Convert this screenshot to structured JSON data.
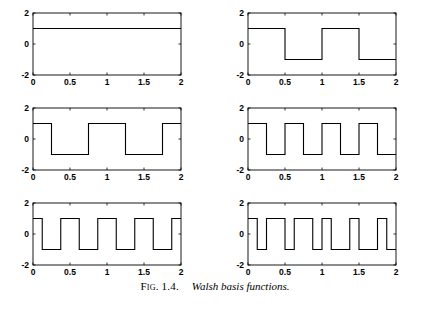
{
  "figure": {
    "caption_label": "Fig. 1.4.",
    "caption_text": "Walsh basis functions.",
    "background": "#ffffff",
    "line_color": "#000000"
  },
  "axes": {
    "xlim": [
      0,
      2
    ],
    "ylim": [
      -2,
      2
    ],
    "xticks": [
      0,
      0.5,
      1,
      1.5,
      2
    ],
    "xtick_labels": [
      "0",
      "0.5",
      "1",
      "1.5",
      "2"
    ],
    "yticks": [
      2,
      0,
      -2
    ],
    "ytick_labels": [
      "2",
      "0",
      "-2"
    ],
    "grid": false
  },
  "chart_data": [
    {
      "type": "line",
      "title": "",
      "name": "walsh-0",
      "sequency": 0,
      "xlabel": "",
      "ylabel": "",
      "xlim": [
        0,
        2
      ],
      "ylim": [
        -2,
        2
      ],
      "xticks": [
        0,
        0.5,
        1,
        1.5,
        2
      ],
      "yticks": [
        -2,
        0,
        2
      ],
      "amplitude": 1,
      "segments": [
        {
          "x0": 0,
          "x1": 2,
          "y": 1
        }
      ]
    },
    {
      "type": "line",
      "title": "",
      "name": "walsh-1",
      "sequency": 1,
      "xlabel": "",
      "ylabel": "",
      "xlim": [
        0,
        2
      ],
      "ylim": [
        -2,
        2
      ],
      "xticks": [
        0,
        0.5,
        1,
        1.5,
        2
      ],
      "yticks": [
        -2,
        0,
        2
      ],
      "amplitude": 1,
      "segments": [
        {
          "x0": 0,
          "x1": 0.5,
          "y": 1
        },
        {
          "x0": 0.5,
          "x1": 1,
          "y": -1
        },
        {
          "x0": 1,
          "x1": 1.5,
          "y": 1
        },
        {
          "x0": 1.5,
          "x1": 2,
          "y": -1
        }
      ]
    },
    {
      "type": "line",
      "title": "",
      "name": "walsh-2",
      "sequency": 2,
      "xlabel": "",
      "ylabel": "",
      "xlim": [
        0,
        2
      ],
      "ylim": [
        -2,
        2
      ],
      "xticks": [
        0,
        0.5,
        1,
        1.5,
        2
      ],
      "yticks": [
        -2,
        0,
        2
      ],
      "amplitude": 1,
      "segments": [
        {
          "x0": 0,
          "x1": 0.25,
          "y": 1
        },
        {
          "x0": 0.25,
          "x1": 0.75,
          "y": -1
        },
        {
          "x0": 0.75,
          "x1": 1.25,
          "y": 1
        },
        {
          "x0": 1.25,
          "x1": 1.75,
          "y": -1
        },
        {
          "x0": 1.75,
          "x1": 2,
          "y": 1
        }
      ]
    },
    {
      "type": "line",
      "title": "",
      "name": "walsh-3",
      "sequency": 3,
      "xlabel": "",
      "ylabel": "",
      "xlim": [
        0,
        2
      ],
      "ylim": [
        -2,
        2
      ],
      "xticks": [
        0,
        0.5,
        1,
        1.5,
        2
      ],
      "yticks": [
        -2,
        0,
        2
      ],
      "amplitude": 1,
      "segments": [
        {
          "x0": 0,
          "x1": 0.25,
          "y": 1
        },
        {
          "x0": 0.25,
          "x1": 0.5,
          "y": -1
        },
        {
          "x0": 0.5,
          "x1": 0.75,
          "y": 1
        },
        {
          "x0": 0.75,
          "x1": 1.0,
          "y": -1
        },
        {
          "x0": 1.0,
          "x1": 1.25,
          "y": 1
        },
        {
          "x0": 1.25,
          "x1": 1.5,
          "y": -1
        },
        {
          "x0": 1.5,
          "x1": 1.75,
          "y": 1
        },
        {
          "x0": 1.75,
          "x1": 2,
          "y": -1
        }
      ]
    },
    {
      "type": "line",
      "title": "",
      "name": "walsh-4",
      "sequency": 4,
      "xlabel": "",
      "ylabel": "",
      "xlim": [
        0,
        2
      ],
      "ylim": [
        -2,
        2
      ],
      "xticks": [
        0,
        0.5,
        1,
        1.5,
        2
      ],
      "yticks": [
        -2,
        0,
        2
      ],
      "amplitude": 1,
      "segments": [
        {
          "x0": 0,
          "x1": 0.125,
          "y": 1
        },
        {
          "x0": 0.125,
          "x1": 0.375,
          "y": -1
        },
        {
          "x0": 0.375,
          "x1": 0.625,
          "y": 1
        },
        {
          "x0": 0.625,
          "x1": 0.875,
          "y": -1
        },
        {
          "x0": 0.875,
          "x1": 1.125,
          "y": 1
        },
        {
          "x0": 1.125,
          "x1": 1.375,
          "y": -1
        },
        {
          "x0": 1.375,
          "x1": 1.625,
          "y": 1
        },
        {
          "x0": 1.625,
          "x1": 1.875,
          "y": -1
        },
        {
          "x0": 1.875,
          "x1": 2,
          "y": 1
        }
      ]
    },
    {
      "type": "line",
      "title": "",
      "name": "walsh-5",
      "sequency": 5,
      "xlabel": "",
      "ylabel": "",
      "xlim": [
        0,
        2
      ],
      "ylim": [
        -2,
        2
      ],
      "xticks": [
        0,
        0.5,
        1,
        1.5,
        2
      ],
      "yticks": [
        -2,
        0,
        2
      ],
      "amplitude": 1,
      "segments": [
        {
          "x0": 0,
          "x1": 0.125,
          "y": 1
        },
        {
          "x0": 0.125,
          "x1": 0.25,
          "y": -1
        },
        {
          "x0": 0.25,
          "x1": 0.5,
          "y": 1
        },
        {
          "x0": 0.5,
          "x1": 0.625,
          "y": -1
        },
        {
          "x0": 0.625,
          "x1": 0.875,
          "y": 1
        },
        {
          "x0": 0.875,
          "x1": 1.0,
          "y": -1
        },
        {
          "x0": 1.0,
          "x1": 1.125,
          "y": 1
        },
        {
          "x0": 1.125,
          "x1": 1.375,
          "y": -1
        },
        {
          "x0": 1.375,
          "x1": 1.5,
          "y": 1
        },
        {
          "x0": 1.5,
          "x1": 1.75,
          "y": -1
        },
        {
          "x0": 1.75,
          "x1": 1.875,
          "y": 1
        },
        {
          "x0": 1.875,
          "x1": 2,
          "y": -1
        }
      ]
    }
  ]
}
